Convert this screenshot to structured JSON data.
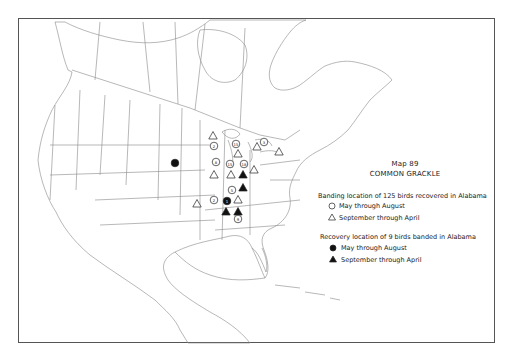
{
  "map": {
    "number_label": "Map 89",
    "species": "COMMON GRACKLE"
  },
  "legend": {
    "banding_header": "Banding location of 125 birds recovered in Alabama",
    "banding_items": [
      {
        "symbol": "open-circle",
        "label": "May through August"
      },
      {
        "symbol": "open-triangle",
        "label": "September through April"
      }
    ],
    "recovery_header": "Recovery location of 9 birds banded in Alabama",
    "recovery_items": [
      {
        "symbol": "filled-circle",
        "label": "May through August"
      },
      {
        "symbol": "filled-triangle",
        "label": "September through April"
      }
    ]
  },
  "markers": [
    {
      "type": "open-triangle",
      "x": 213,
      "y": 136,
      "count": ""
    },
    {
      "type": "open-circle",
      "x": 214,
      "y": 146,
      "count": "2"
    },
    {
      "type": "open-circle",
      "x": 236,
      "y": 144,
      "count": "15"
    },
    {
      "type": "open-triangle",
      "x": 238,
      "y": 154,
      "count": ""
    },
    {
      "type": "open-triangle",
      "x": 257,
      "y": 147,
      "count": ""
    },
    {
      "type": "open-circle",
      "x": 264,
      "y": 142,
      "count": "3"
    },
    {
      "type": "open-triangle",
      "x": 279,
      "y": 152,
      "count": ""
    },
    {
      "type": "open-circle",
      "x": 216,
      "y": 162,
      "count": "8"
    },
    {
      "type": "open-circle",
      "x": 230,
      "y": 164,
      "count": "15"
    },
    {
      "type": "open-circle",
      "x": 244,
      "y": 164,
      "count": "18"
    },
    {
      "type": "open-triangle",
      "x": 254,
      "y": 170,
      "count": ""
    },
    {
      "type": "open-triangle",
      "x": 214,
      "y": 175,
      "count": ""
    },
    {
      "type": "open-triangle",
      "x": 231,
      "y": 175,
      "count": ""
    },
    {
      "type": "filled-triangle",
      "x": 243,
      "y": 175,
      "count": ""
    },
    {
      "type": "filled-triangle",
      "x": 243,
      "y": 188,
      "count": ""
    },
    {
      "type": "open-circle",
      "x": 232,
      "y": 190,
      "count": "5"
    },
    {
      "type": "open-circle",
      "x": 214,
      "y": 200,
      "count": "2"
    },
    {
      "type": "open-triangle",
      "x": 197,
      "y": 204,
      "count": ""
    },
    {
      "type": "filled-circle",
      "x": 227,
      "y": 201,
      "count": "1"
    },
    {
      "type": "open-triangle",
      "x": 238,
      "y": 200,
      "count": ""
    },
    {
      "type": "filled-triangle",
      "x": 226,
      "y": 212,
      "count": ""
    },
    {
      "type": "filled-triangle",
      "x": 238,
      "y": 212,
      "count": ""
    },
    {
      "type": "open-circle",
      "x": 238,
      "y": 219,
      "count": "9"
    },
    {
      "type": "filled-circle",
      "x": 175,
      "y": 163,
      "count": ""
    }
  ]
}
